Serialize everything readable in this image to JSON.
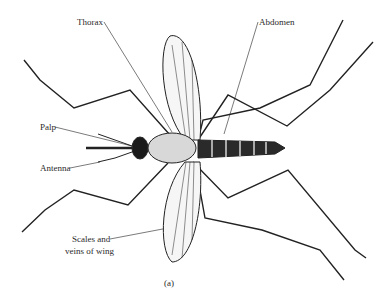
{
  "figure": {
    "caption": "(a)",
    "labels": {
      "thorax": "Thorax",
      "abdomen": "Abdomen",
      "palp": "Palp",
      "antenna": "Antenna",
      "wing_line1": "Scales and",
      "wing_line2": "veins of wing"
    }
  }
}
